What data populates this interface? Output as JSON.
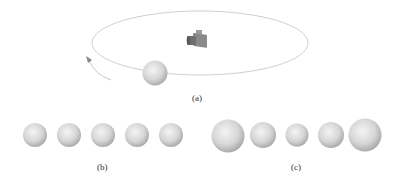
{
  "figure": {
    "panels": [
      {
        "id": "a",
        "caption": "(a)",
        "description": "Sphere orbiting around a camera on an elliptical path"
      },
      {
        "id": "b",
        "caption": "(b)",
        "description": "Five equally sized spheres in a row"
      },
      {
        "id": "c",
        "caption": "(c)",
        "description": "Five spheres of varying size: large, medium, small, medium, large"
      }
    ],
    "icons": {
      "camera": "camera-icon",
      "sphere": "sphere-icon",
      "orbit": "orbit-ellipse",
      "arrow": "rotation-arrow-icon"
    },
    "colors": {
      "sphere_light": "#f2f2f2",
      "sphere_dark": "#a8a8a8",
      "orbit_line": "#c8c8c8",
      "camera_body": "#7a7a7a"
    }
  }
}
